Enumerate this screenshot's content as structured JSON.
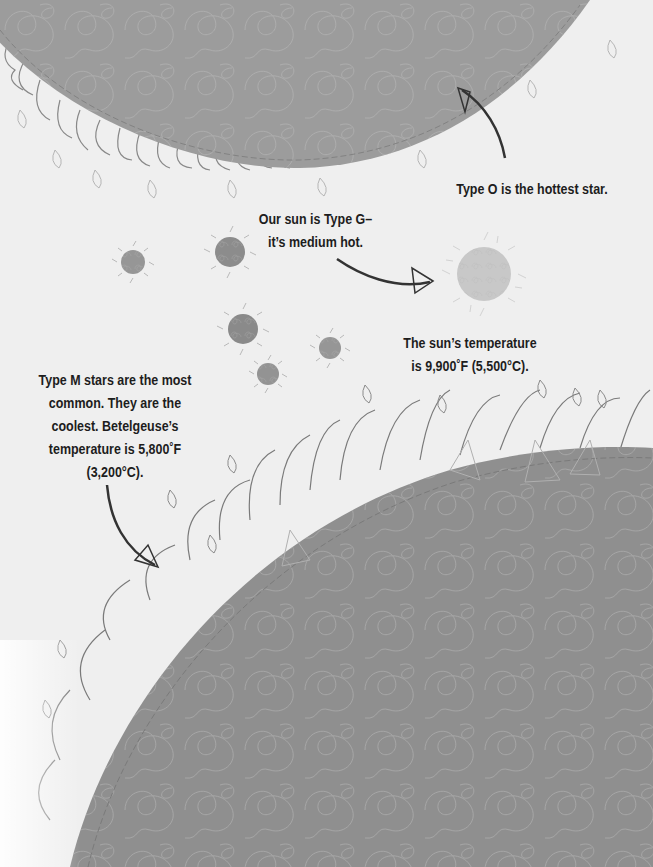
{
  "captions": {
    "type_o": {
      "lines": [
        "Type O is the hottest star."
      ]
    },
    "type_g": {
      "lines": [
        "Our sun is Type G–",
        "it’s medium hot."
      ]
    },
    "sun_temp": {
      "lines": [
        "The sun’s temperature",
        "is 9,900˚F (5,500°C)."
      ]
    },
    "type_m": {
      "lines": [
        "Type M stars are the most",
        "common. They are the",
        "coolest. Betelgeuse’s",
        "temperature is 5,800˚F",
        "(3,200°C)."
      ]
    }
  },
  "illustrations": {
    "top_star": {
      "label": "type-o-star",
      "fill": "#9c9c9c"
    },
    "sun": {
      "label": "type-g-sun",
      "fill": "#c8c8c8"
    },
    "bottom_star": {
      "label": "type-m-star-betelgeuse",
      "fill": "#8f8f8f"
    },
    "small_stars": 6
  },
  "colors": {
    "background": "#efefef",
    "text": "#1d1d1d",
    "arrow": "#333333",
    "flame_stroke": "#7a7a7a",
    "flame_light": "#b5b5b5",
    "swirl": "#b8b8b8"
  }
}
